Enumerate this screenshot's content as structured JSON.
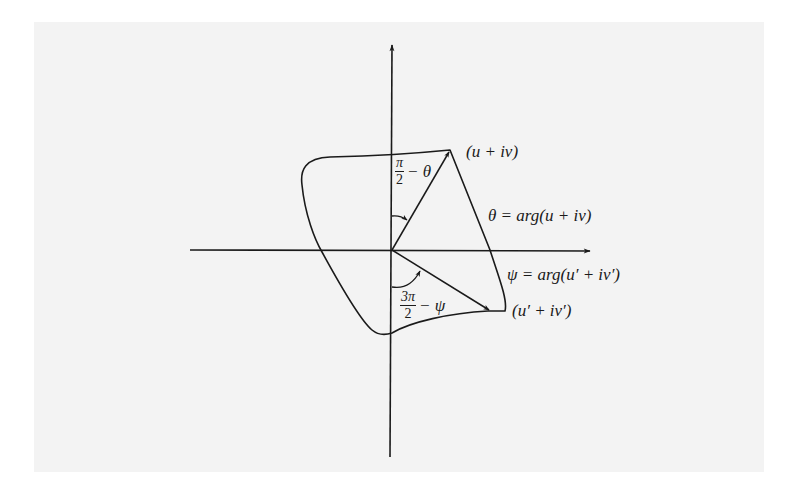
{
  "figure": {
    "colors": {
      "ink": "#1a1a1a",
      "paper": "#f3f3f3",
      "margin": "#ffffff"
    },
    "axes": {
      "x_axis": {
        "from": [
          190,
          250
        ],
        "to": [
          592,
          250
        ],
        "arrow": true
      },
      "y_axis": {
        "from": [
          390,
          457
        ],
        "to": [
          392,
          43
        ],
        "arrow": true
      },
      "origin": [
        392,
        250
      ]
    },
    "points": {
      "p1": {
        "label": "(u + iv)",
        "xy": [
          450,
          150
        ]
      },
      "p2": {
        "label": "(u′ + iv′)",
        "xy": [
          492,
          311
        ]
      }
    },
    "labels": {
      "point1": "(u + iv)",
      "point2": "(u′ + iv′)",
      "theta_def": "θ = arg(u + iv)",
      "psi_def": "ψ = arg(u′ + iv′)",
      "angle1": {
        "numerator": "π",
        "denominator": "2",
        "rest": "− θ"
      },
      "angle2": {
        "numerator": "3π",
        "denominator": "2",
        "rest": "− ψ"
      }
    },
    "icons": {
      "x_axis_arrow": "arrowhead-right-icon",
      "y_axis_arrow": "arrowhead-up-icon"
    }
  }
}
